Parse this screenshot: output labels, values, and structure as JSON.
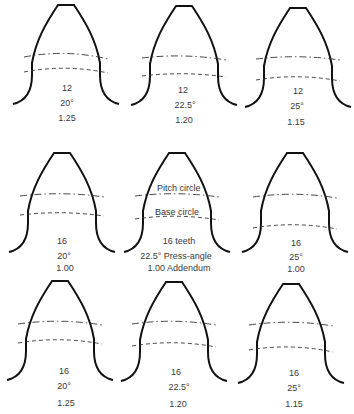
{
  "figure": {
    "callouts": {
      "pitch_circle": "Pitch circle",
      "base_circle": "Base circle"
    },
    "teeth": [
      {
        "row": 0,
        "col": 0,
        "teeth": "12",
        "pressure_angle": "20°",
        "addendum": "1.25"
      },
      {
        "row": 0,
        "col": 1,
        "teeth": "12",
        "pressure_angle": "22.5°",
        "addendum": "1.20"
      },
      {
        "row": 0,
        "col": 2,
        "teeth": "12",
        "pressure_angle": "25°",
        "addendum": "1.15"
      },
      {
        "row": 1,
        "col": 0,
        "teeth": "16",
        "pressure_angle": "20°",
        "addendum": "1.00"
      },
      {
        "row": 1,
        "col": 1,
        "teeth": "16 teeth",
        "pressure_angle": "22.5° Press-angle",
        "addendum": "1.00 Addendum"
      },
      {
        "row": 1,
        "col": 2,
        "teeth": "16",
        "pressure_angle": "25°",
        "addendum": "1.00"
      },
      {
        "row": 2,
        "col": 0,
        "teeth": "16",
        "pressure_angle": "20°",
        "addendum": "1.25"
      },
      {
        "row": 2,
        "col": 1,
        "teeth": "16",
        "pressure_angle": "22.5°",
        "addendum": "1.20"
      },
      {
        "row": 2,
        "col": 2,
        "teeth": "16",
        "pressure_angle": "25°",
        "addendum": "1.15"
      }
    ]
  }
}
